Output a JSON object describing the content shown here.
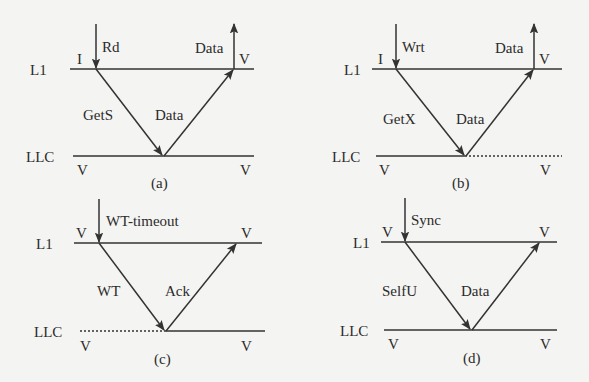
{
  "figure": {
    "type": "protocol-message-sequence-diagrams",
    "levels": {
      "top": "L1",
      "bottom": "LLC"
    },
    "panels": [
      {
        "caption": "(a)",
        "trigger": "Rd",
        "request": "GetS",
        "response": "Data",
        "output": "Data",
        "l1_state_before": "I",
        "l1_state_after": "V",
        "llc_state_before": "V",
        "llc_state_after": "V",
        "llc_left_style": "solid",
        "llc_right_style": "solid",
        "has_output_arrow": true
      },
      {
        "caption": "(b)",
        "trigger": "Wrt",
        "request": "GetX",
        "response": "Data",
        "output": "Data",
        "l1_state_before": "I",
        "l1_state_after": "V",
        "llc_state_before": "V",
        "llc_state_after": "V",
        "llc_left_style": "solid",
        "llc_right_style": "dotted",
        "has_output_arrow": true
      },
      {
        "caption": "(c)",
        "trigger": "WT-timeout",
        "request": "WT",
        "response": "Ack",
        "l1_state_before": "V",
        "l1_state_after": "V",
        "llc_state_before": "V",
        "llc_state_after": "V",
        "llc_left_style": "dotted",
        "llc_right_style": "solid",
        "has_output_arrow": false
      },
      {
        "caption": "(d)",
        "trigger": "Sync",
        "request": "SelfU",
        "response": "Data",
        "l1_state_before": "V",
        "l1_state_after": "V",
        "llc_state_before": "V",
        "llc_state_after": "V",
        "llc_left_style": "solid",
        "llc_right_style": "solid",
        "has_output_arrow": false
      }
    ]
  }
}
